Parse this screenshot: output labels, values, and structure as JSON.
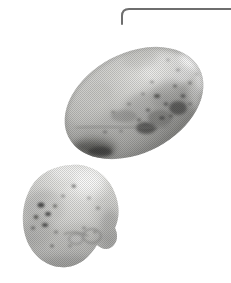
{
  "page": {
    "background_color": "#ffffff",
    "width": 231,
    "height": 283,
    "caption": ""
  },
  "rule": {
    "name": "page-frame-rule",
    "color": "#6e6e6e",
    "thickness": 2,
    "corner_radius": 14,
    "start_x": 122,
    "start_y": 24,
    "corner_x": 136,
    "corner_y": 9,
    "end_x": 231,
    "end_y": 9
  },
  "photo": {
    "title": "",
    "subject": "two potatoes",
    "style": "halftone grayscale print",
    "objects": [
      {
        "name": "large-potato",
        "shape": "ellipse",
        "center_x": 134,
        "center_y": 103,
        "radius_x": 74,
        "radius_y": 50,
        "rotation_deg": -28,
        "base_color": "#b9b9b7",
        "highlight_color": "#f1f1ef",
        "shadow_color": "#6a6a68",
        "speckles": 54
      },
      {
        "name": "small-potato",
        "shape": "blob",
        "center_x": 71,
        "center_y": 216,
        "radius_x": 47,
        "radius_y": 51,
        "rotation_deg": -8,
        "base_color": "#c6c6c4",
        "highlight_color": "#f3f3f1",
        "shadow_color": "#787876",
        "speckles": 40
      }
    ]
  }
}
